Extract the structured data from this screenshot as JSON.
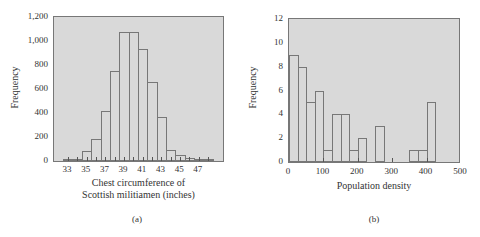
{
  "chart_data": [
    {
      "type": "bar",
      "panel_label": "(a)",
      "title": "",
      "xlabel": "Chest circumference of Scottish militiamen (inches)",
      "xlabel_lines": [
        "Chest circumference of",
        "Scottish militiamen (inches)"
      ],
      "ylabel": "Frequency",
      "categories": [
        33,
        34,
        35,
        36,
        37,
        38,
        39,
        40,
        41,
        42,
        43,
        44,
        45,
        46,
        47,
        48
      ],
      "values": [
        3,
        18,
        81,
        185,
        420,
        749,
        1073,
        1079,
        934,
        658,
        370,
        92,
        50,
        21,
        4,
        1
      ],
      "xticks": [
        "33",
        "35",
        "37",
        "39",
        "41",
        "43",
        "45",
        "47"
      ],
      "yticks": [
        "0",
        "200",
        "400",
        "600",
        "800",
        "1,000",
        "1,200"
      ],
      "ylim": [
        0,
        1200
      ],
      "grid": false
    },
    {
      "type": "bar",
      "panel_label": "(b)",
      "title": "",
      "xlabel": "Population density",
      "ylabel": "Frequency",
      "bin_width": 25,
      "bin_starts": [
        0,
        25,
        50,
        75,
        100,
        125,
        150,
        175,
        200,
        225,
        250,
        275,
        300,
        325,
        350,
        375,
        400
      ],
      "values": [
        9,
        8,
        5,
        6,
        1,
        4,
        4,
        1,
        2,
        0,
        3,
        0,
        0,
        0,
        1,
        1,
        5
      ],
      "xticks": [
        "0",
        "100",
        "200",
        "300",
        "400",
        "500"
      ],
      "yticks": [
        "0",
        "2",
        "4",
        "6",
        "8",
        "10",
        "12"
      ],
      "xlim": [
        0,
        500
      ],
      "ylim": [
        0,
        12
      ],
      "grid": false
    }
  ],
  "colors": {
    "plot_bg": "#d9d9d9",
    "bar_edge": "#777777",
    "text": "#333333"
  }
}
